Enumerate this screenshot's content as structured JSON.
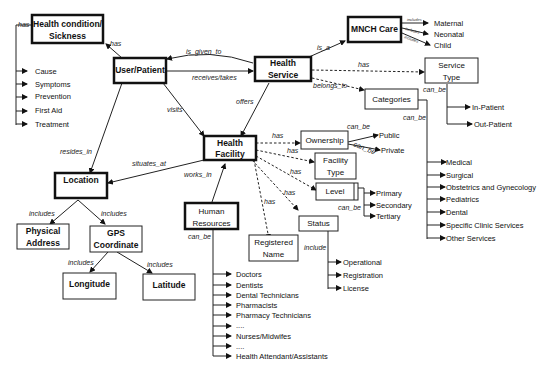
{
  "nodes": {
    "health_condition": [
      "Health condition/",
      "Sickness"
    ],
    "user_patient": "User/Patient",
    "health_service": [
      "Health",
      "Service"
    ],
    "mnch_care": "MNCH Care",
    "service_type": [
      "Service",
      "Type"
    ],
    "categories": "Categories",
    "health_facility": [
      "Health",
      "Facility"
    ],
    "location": "Location",
    "physical_address": [
      "Physical",
      "Address"
    ],
    "gps_coordinate": [
      "GPS",
      "Coordinate"
    ],
    "longitude": "Longitude",
    "latitude": "Latitude",
    "human_resources": [
      "Human",
      "Resources"
    ],
    "ownership": "Ownership",
    "facility_type": [
      "Facility",
      "Type"
    ],
    "level": "Level",
    "status": "Status",
    "registered_name": [
      "Registered",
      "Name"
    ]
  },
  "edges": {
    "has": "has",
    "is_given_to": "is_given_to",
    "receives_takes": "receives/takes",
    "is_a": "is_a",
    "belongs_to": "belongs_to",
    "can_be": "can_be",
    "visits": "visits",
    "offers": "offers",
    "resides_in": "resides_in",
    "situates_at": "situates_at",
    "works_in": "works_in",
    "includes": "includes",
    "include": "include"
  },
  "lists": {
    "condition_items": [
      "Cause",
      "Symptoms",
      "Prevention",
      "First Aid",
      "Treatment"
    ],
    "mnch_items": [
      "Maternal",
      "Neonatal",
      "Child"
    ],
    "service_type_items": [
      "In-Patient",
      "Out-Patient"
    ],
    "category_items": [
      "Medical",
      "Surgical",
      "Obstetrics and Gynecology",
      "Pediatrics",
      "Dental",
      "Specific Clinic Services",
      "Other Services"
    ],
    "ownership_items": [
      "Public",
      "Private"
    ],
    "level_items": [
      "Primary",
      "Secondary",
      "Tertiary"
    ],
    "status_items": [
      "Operational",
      "Registration",
      "License"
    ],
    "hr_items": [
      "Doctors",
      "Dentists",
      "Dental Technicians",
      "Pharmacists",
      "Pharmacy Technicians",
      "....",
      "Nurses/Midwifes",
      "....",
      "Health Attendant/Assistants"
    ]
  }
}
